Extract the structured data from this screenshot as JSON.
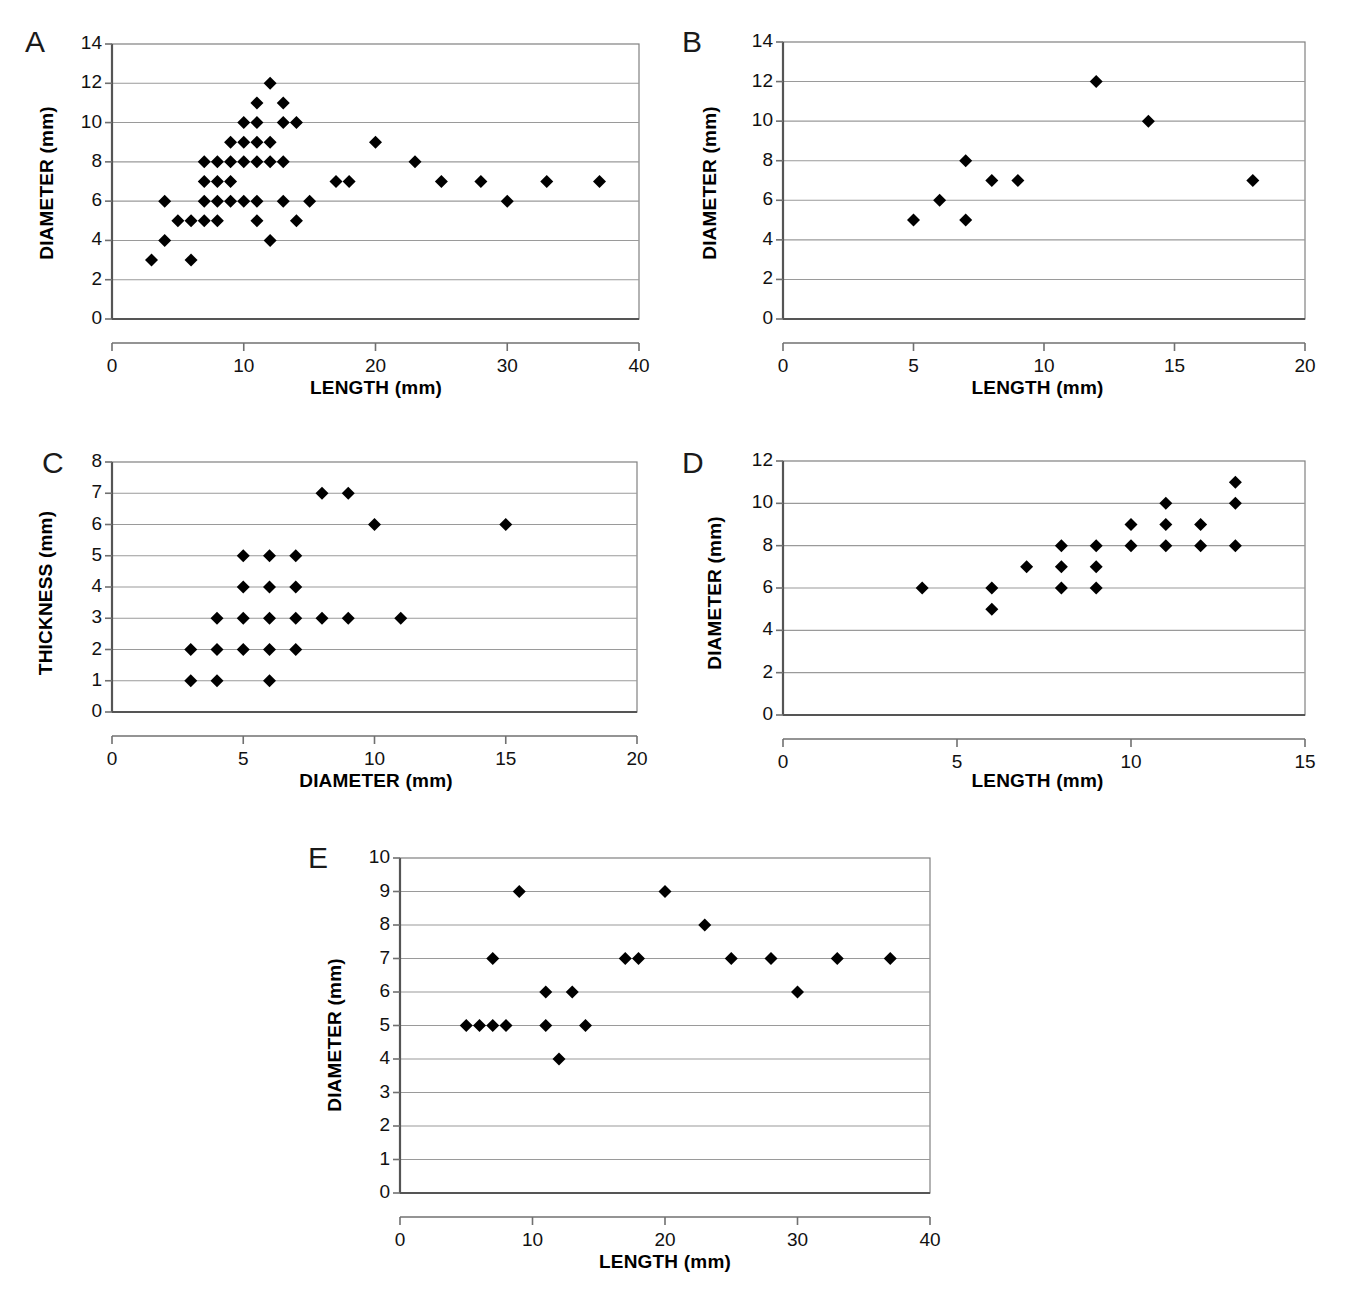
{
  "figure": {
    "panels": [
      {
        "id": "A",
        "label": "A",
        "chart_data": {
          "type": "scatter",
          "title": "",
          "xlabel": "LENGTH (mm)",
          "ylabel": "DIAMETER (mm)",
          "xlim": [
            0,
            40
          ],
          "ylim": [
            0,
            14
          ],
          "xticks": [
            0,
            10,
            20,
            30,
            40
          ],
          "yticks": [
            0,
            2,
            4,
            6,
            8,
            10,
            12,
            14
          ],
          "xtick_labels": [
            "0",
            "10",
            "20",
            "30",
            "40"
          ],
          "ytick_labels": [
            "0",
            "2",
            "4",
            "6",
            "8",
            "10",
            "12",
            "14"
          ],
          "grid": "horizontal",
          "legend": "none",
          "marker": "filled-diamond",
          "points": [
            [
              3,
              3
            ],
            [
              6,
              3
            ],
            [
              4,
              4
            ],
            [
              12,
              4
            ],
            [
              5,
              5
            ],
            [
              6,
              5
            ],
            [
              7,
              5
            ],
            [
              8,
              5
            ],
            [
              11,
              5
            ],
            [
              14,
              5
            ],
            [
              4,
              6
            ],
            [
              7,
              6
            ],
            [
              8,
              6
            ],
            [
              9,
              6
            ],
            [
              10,
              6
            ],
            [
              11,
              6
            ],
            [
              13,
              6
            ],
            [
              15,
              6
            ],
            [
              30,
              6
            ],
            [
              7,
              7
            ],
            [
              8,
              7
            ],
            [
              9,
              7
            ],
            [
              17,
              7
            ],
            [
              18,
              7
            ],
            [
              25,
              7
            ],
            [
              28,
              7
            ],
            [
              33,
              7
            ],
            [
              37,
              7
            ],
            [
              7,
              8
            ],
            [
              8,
              8
            ],
            [
              9,
              8
            ],
            [
              10,
              8
            ],
            [
              11,
              8
            ],
            [
              12,
              8
            ],
            [
              13,
              8
            ],
            [
              23,
              8
            ],
            [
              9,
              9
            ],
            [
              10,
              9
            ],
            [
              11,
              9
            ],
            [
              12,
              9
            ],
            [
              20,
              9
            ],
            [
              10,
              10
            ],
            [
              11,
              10
            ],
            [
              13,
              10
            ],
            [
              14,
              10
            ],
            [
              11,
              11
            ],
            [
              13,
              11
            ],
            [
              12,
              12
            ]
          ]
        }
      },
      {
        "id": "B",
        "label": "B",
        "chart_data": {
          "type": "scatter",
          "title": "",
          "xlabel": "LENGTH (mm)",
          "ylabel": "DIAMETER (mm)",
          "xlim": [
            0,
            20
          ],
          "ylim": [
            0,
            14
          ],
          "xticks": [
            0,
            5,
            10,
            15,
            20
          ],
          "yticks": [
            0,
            2,
            4,
            6,
            8,
            10,
            12,
            14
          ],
          "xtick_labels": [
            "0",
            "5",
            "10",
            "15",
            "20"
          ],
          "ytick_labels": [
            "0",
            "2",
            "4",
            "6",
            "8",
            "10",
            "12",
            "14"
          ],
          "grid": "horizontal",
          "legend": "none",
          "marker": "filled-diamond",
          "points": [
            [
              5,
              5
            ],
            [
              6,
              6
            ],
            [
              7,
              8
            ],
            [
              7,
              5
            ],
            [
              8,
              7
            ],
            [
              9,
              7
            ],
            [
              12,
              12
            ],
            [
              14,
              10
            ],
            [
              18,
              7
            ]
          ]
        }
      },
      {
        "id": "C",
        "label": "C",
        "chart_data": {
          "type": "scatter",
          "title": "",
          "xlabel": "DIAMETER (mm)",
          "ylabel": "THICKNESS (mm)",
          "xlim": [
            0,
            20
          ],
          "ylim": [
            0,
            8
          ],
          "xticks": [
            0,
            5,
            10,
            15,
            20
          ],
          "yticks": [
            0,
            1,
            2,
            3,
            4,
            5,
            6,
            7,
            8
          ],
          "xtick_labels": [
            "0",
            "5",
            "10",
            "15",
            "20"
          ],
          "ytick_labels": [
            "0",
            "1",
            "2",
            "3",
            "4",
            "5",
            "6",
            "7",
            "8"
          ],
          "grid": "horizontal",
          "legend": "none",
          "marker": "filled-diamond",
          "points": [
            [
              3,
              1
            ],
            [
              4,
              1
            ],
            [
              6,
              1
            ],
            [
              3,
              2
            ],
            [
              4,
              2
            ],
            [
              5,
              2
            ],
            [
              6,
              2
            ],
            [
              7,
              2
            ],
            [
              4,
              3
            ],
            [
              5,
              3
            ],
            [
              6,
              3
            ],
            [
              7,
              3
            ],
            [
              8,
              3
            ],
            [
              9,
              3
            ],
            [
              11,
              3
            ],
            [
              5,
              4
            ],
            [
              6,
              4
            ],
            [
              7,
              4
            ],
            [
              5,
              5
            ],
            [
              6,
              5
            ],
            [
              7,
              5
            ],
            [
              10,
              6
            ],
            [
              15,
              6
            ],
            [
              8,
              7
            ],
            [
              9,
              7
            ]
          ]
        }
      },
      {
        "id": "D",
        "label": "D",
        "chart_data": {
          "type": "scatter",
          "title": "",
          "xlabel": "LENGTH (mm)",
          "ylabel": "DIAMETER (mm)",
          "xlim": [
            0,
            15
          ],
          "ylim": [
            0,
            12
          ],
          "xticks": [
            0,
            5,
            10,
            15
          ],
          "yticks": [
            0,
            2,
            4,
            6,
            8,
            10,
            12
          ],
          "xtick_labels": [
            "0",
            "5",
            "10",
            "15"
          ],
          "ytick_labels": [
            "0",
            "2",
            "4",
            "6",
            "8",
            "10",
            "12"
          ],
          "grid": "horizontal",
          "legend": "none",
          "marker": "filled-diamond",
          "points": [
            [
              4,
              6
            ],
            [
              6,
              5
            ],
            [
              6,
              6
            ],
            [
              7,
              7
            ],
            [
              8,
              6
            ],
            [
              8,
              7
            ],
            [
              8,
              8
            ],
            [
              9,
              6
            ],
            [
              9,
              7
            ],
            [
              9,
              8
            ],
            [
              10,
              8
            ],
            [
              10,
              9
            ],
            [
              11,
              8
            ],
            [
              11,
              9
            ],
            [
              11,
              10
            ],
            [
              12,
              8
            ],
            [
              12,
              9
            ],
            [
              13,
              8
            ],
            [
              13,
              10
            ],
            [
              13,
              11
            ]
          ]
        }
      },
      {
        "id": "E",
        "label": "E",
        "chart_data": {
          "type": "scatter",
          "title": "",
          "xlabel": "LENGTH (mm)",
          "ylabel": "DIAMETER (mm)",
          "xlim": [
            0,
            40
          ],
          "ylim": [
            0,
            10
          ],
          "xticks": [
            0,
            10,
            20,
            30,
            40
          ],
          "yticks": [
            0,
            1,
            2,
            3,
            4,
            5,
            6,
            7,
            8,
            9,
            10
          ],
          "xtick_labels": [
            "0",
            "10",
            "20",
            "30",
            "40"
          ],
          "ytick_labels": [
            "0",
            "1",
            "2",
            "3",
            "4",
            "5",
            "6",
            "7",
            "8",
            "9",
            "10"
          ],
          "grid": "horizontal",
          "legend": "none",
          "marker": "filled-diamond",
          "points": [
            [
              12,
              4
            ],
            [
              5,
              5
            ],
            [
              6,
              5
            ],
            [
              7,
              5
            ],
            [
              8,
              5
            ],
            [
              11,
              5
            ],
            [
              14,
              5
            ],
            [
              11,
              6
            ],
            [
              13,
              6
            ],
            [
              30,
              6
            ],
            [
              7,
              7
            ],
            [
              17,
              7
            ],
            [
              18,
              7
            ],
            [
              25,
              7
            ],
            [
              28,
              7
            ],
            [
              33,
              7
            ],
            [
              37,
              7
            ],
            [
              23,
              8
            ],
            [
              9,
              9
            ],
            [
              20,
              9
            ]
          ]
        }
      }
    ]
  },
  "colors": {
    "marker": "#000000",
    "gridline": "#9a9a9a",
    "frame": "#808080",
    "axis": "#707070",
    "background": "#ffffff",
    "text": "#000000"
  }
}
